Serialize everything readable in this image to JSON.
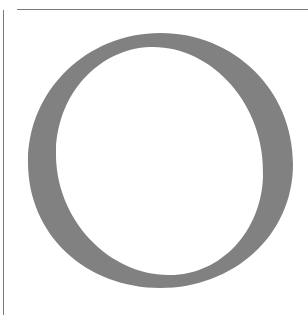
{
  "illustration": {
    "glyph": "O",
    "description": "Large serif capital letter O",
    "fill_color": "#818181",
    "rule_color": "#7a7a7a",
    "background": "#ffffff"
  }
}
